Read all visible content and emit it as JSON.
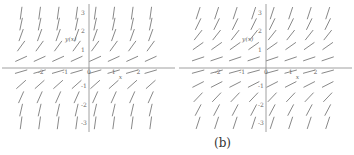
{
  "chart_data": [
    {
      "type": "slope-field",
      "panel": "a",
      "caption": "",
      "xlabel": "x",
      "ylabel": "y(x)",
      "xlim": [
        -3.2,
        3.2
      ],
      "ylim": [
        -3.5,
        3.5
      ],
      "x_ticks": [
        "-2",
        "-1",
        "0",
        "1",
        "2"
      ],
      "x_tick_values": [
        -2,
        -1,
        0,
        1,
        2
      ],
      "y_ticks": [
        "3",
        "2",
        "1",
        "-1",
        "-2",
        "-3"
      ],
      "y_tick_values": [
        3,
        2,
        1,
        -1,
        -2,
        -3
      ],
      "grid_x": [
        -2.75,
        -2.0,
        -1.25,
        -0.5,
        0.25,
        1.0,
        1.75,
        2.5
      ],
      "grid_y": [
        3.0,
        2.4,
        1.8,
        1.2,
        0.5,
        -0.2,
        -0.9,
        -1.6,
        -2.3,
        -3.0
      ],
      "slope_rule": "depends on y only; steep for |y| large, shallow near y=0",
      "slope_k": 3.0,
      "slope_c": 0.35
    },
    {
      "type": "slope-field",
      "panel": "b",
      "caption": "(b)",
      "xlabel": "x",
      "ylabel": "y(x)",
      "xlim": [
        -3.2,
        3.2
      ],
      "ylim": [
        -3.5,
        3.5
      ],
      "x_ticks": [
        "-2",
        "-1",
        "0",
        "1",
        "2"
      ],
      "x_tick_values": [
        -2,
        -1,
        0,
        1,
        2
      ],
      "y_ticks": [
        "3",
        "2",
        "1",
        "-1",
        "-2",
        "-3"
      ],
      "y_tick_values": [
        3,
        2,
        1,
        -1,
        -2,
        -3
      ],
      "grid_x": [
        -2.75,
        -2.0,
        -1.25,
        -0.5,
        0.25,
        1.0,
        1.75,
        2.5
      ],
      "grid_y": [
        3.0,
        2.4,
        1.8,
        1.2,
        0.5,
        -0.2,
        -0.9,
        -1.6,
        -2.3,
        -3.0
      ],
      "slope_rule": "depends on y only; moderately steep for |y| large, shallow near y=0",
      "slope_k": 1.2,
      "slope_c": 0.35
    }
  ],
  "caption_b": "(b)"
}
